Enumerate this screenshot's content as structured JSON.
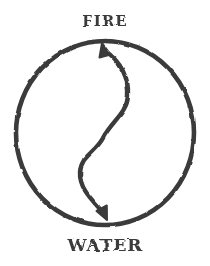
{
  "diagram": {
    "top_label": "FIRE",
    "bottom_label": "WATER",
    "icons": {
      "arrow_up": "arrowhead-up-icon",
      "arrow_down": "arrowhead-down-icon"
    }
  },
  "colors": {
    "ink": "#3a3a3a",
    "background": "#ffffff"
  }
}
